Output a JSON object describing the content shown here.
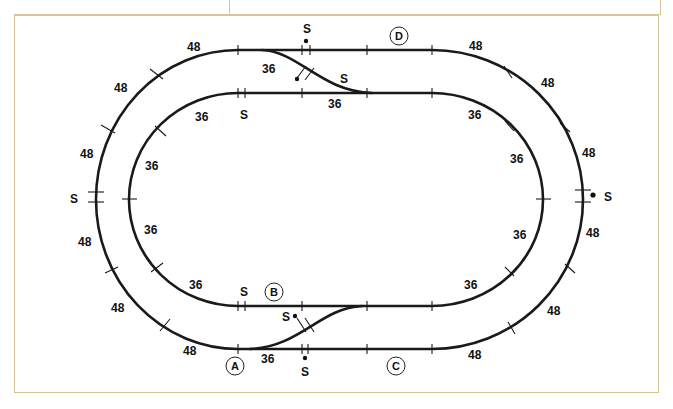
{
  "diagram": {
    "colors": {
      "track": "#1a1a1a",
      "frame_border": "#d9c49a",
      "background": "#ffffff"
    },
    "outer_loop": {
      "radius_label": "48",
      "curve_section_labels": [
        "48",
        "48",
        "48",
        "48",
        "48",
        "48",
        "48",
        "48",
        "48",
        "48",
        "48"
      ]
    },
    "inner_loop": {
      "radius_label": "36",
      "curve_section_labels": [
        "36",
        "36",
        "36",
        "36",
        "36",
        "36",
        "36",
        "36"
      ]
    },
    "switch_label": "S",
    "crossover_curve_label": "36",
    "points": {
      "A": "A",
      "B": "B",
      "C": "C",
      "D": "D"
    },
    "labels": {
      "outer_top_left": "48",
      "outer_left_upper1": "48",
      "outer_left_upper2": "48",
      "outer_left_lower1": "48",
      "outer_left_lower2": "48",
      "outer_bottom_left": "48",
      "outer_top_right": "48",
      "outer_right_upper1": "48",
      "outer_right_upper2": "48",
      "outer_right_lower1": "48",
      "outer_right_lower2": "48",
      "outer_bottom_right": "48",
      "inner_top_left": "36",
      "inner_left_upper": "36",
      "inner_left_lower": "36",
      "inner_bottom_left": "36",
      "inner_top_right": "36",
      "inner_right_upper": "36",
      "inner_right_lower": "36",
      "inner_bottom_right": "36",
      "crossover_top_curve": "36",
      "crossover_top_straight": "36",
      "crossover_bottom_curve": "36",
      "switch_top_outer": "S",
      "switch_top_cross": "S",
      "switch_top_inner": "S",
      "switch_left_outer": "S",
      "switch_right_outer": "S",
      "switch_bottom_inner": "S",
      "switch_bottom_cross": "S",
      "switch_bottom_outer": "S"
    }
  }
}
